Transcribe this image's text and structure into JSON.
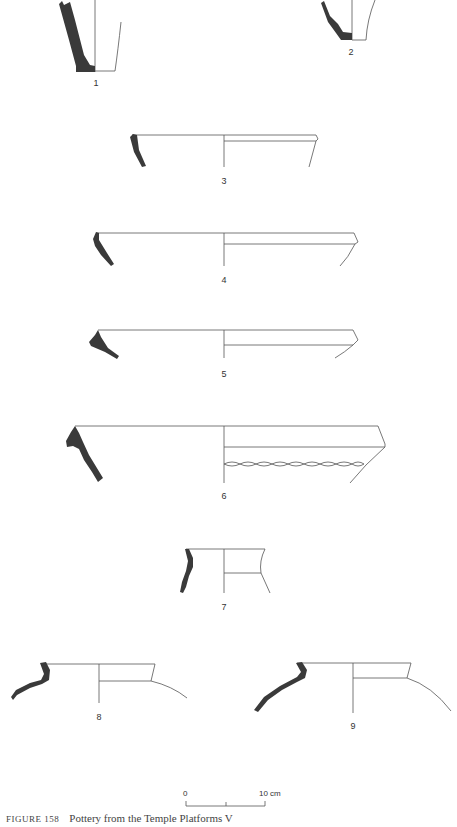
{
  "figure": {
    "caption_label": "FIGURE 158",
    "caption_text": "Pottery from the Temple Platforms V",
    "colors": {
      "section_fill": "#3a3a3a",
      "outline": "#555555",
      "background": "#ffffff"
    }
  },
  "vessels": [
    {
      "number": "1",
      "type": "base/body sherd"
    },
    {
      "number": "2",
      "type": "base/body sherd"
    },
    {
      "number": "3",
      "type": "rim, open bowl"
    },
    {
      "number": "4",
      "type": "rim, open bowl"
    },
    {
      "number": "5",
      "type": "rim, open bowl"
    },
    {
      "number": "6",
      "type": "rim, bowl with twisted-cord band"
    },
    {
      "number": "7",
      "type": "rim, everted neck"
    },
    {
      "number": "8",
      "type": "rim, jar shoulder"
    },
    {
      "number": "9",
      "type": "rim, jar shoulder"
    }
  ],
  "scale_bar": {
    "start_label": "0",
    "end_label": "10 cm"
  }
}
